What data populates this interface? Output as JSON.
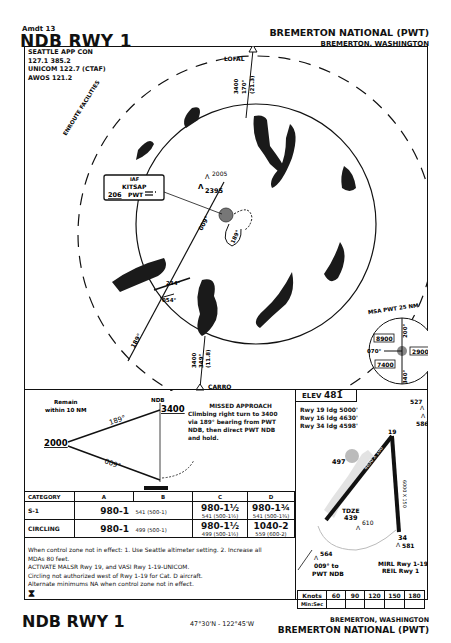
{
  "header": {
    "amendment": "Amdt 13",
    "procedure": "NDB RWY 1",
    "airport": "BREMERTON NATIONAL (PWT)",
    "city": "BREMERTON, WASHINGTON"
  },
  "comms": {
    "line1": "SEATTLE APP CON",
    "line2": "127.1 385.2",
    "line3": "UNICOM 122.7 (CTAF)",
    "line4": "AWOS 121.2"
  },
  "plan_view": {
    "enroute_label": "ENROUTE FACILITIES",
    "fixes": {
      "lofal": {
        "name": "LOFAL",
        "alt": "3400",
        "course": "170°",
        "dist": "(21.3)"
      },
      "carro": {
        "name": "CARRO",
        "alt": "3400",
        "course": "349°",
        "dist": "(11.8)"
      }
    },
    "iaf_box": {
      "label": "IAF",
      "name": "KITSAP",
      "freq": "206",
      "ident": "PWT"
    },
    "obstacles": {
      "o1": "2005",
      "o2": "2395"
    },
    "courses": {
      "inbound": "009°",
      "outbound": "189°",
      "procedure_out": "234°",
      "procedure_in": "054°",
      "radial": "189°"
    },
    "msa": {
      "title": "MSA PWT 25 NM",
      "sector_nw": "8900",
      "sector_e": "2900",
      "sector_sw": "7400",
      "b1": "200°",
      "b2": "070°",
      "b3": "340°"
    }
  },
  "profile": {
    "remain": "Remain",
    "remain2": "within 10 NM",
    "ndb": "NDB",
    "ndb_alt": "3400",
    "hold_alt": "2000",
    "out_course": "189°",
    "in_course": "009°",
    "missed_title": "MISSED APPROACH",
    "missed_text1": "Climbing right turn to 3400",
    "missed_text2": "via 189° bearing from PWT",
    "missed_text3": "NDB, then direct PWT NDB",
    "missed_text4": "and hold."
  },
  "airport_diagram": {
    "elev_label": "ELEV",
    "elev": "481",
    "ldg1": "Rwy 19 ldg 5000'",
    "ldg2": "Rwy 16 ldg 4630'",
    "ldg3": "Rwy 34 ldg 4598'",
    "obs": {
      "o527": "527",
      "o586": "586",
      "o497": "497",
      "o610": "610",
      "o581": "581",
      "o564": "564"
    },
    "tdze_label": "TDZE",
    "tdze": "439",
    "rwy_n1": "1",
    "rwy_n2": "19",
    "rwy_n3": "16",
    "rwy_34": "34",
    "rwy_dims": "6000 X 150",
    "ndb_course": "009° to",
    "ndb_name": "PWT NDB",
    "lighting1": "MIRL Rwy 1-19",
    "lighting2": "REIL Rwy 1"
  },
  "minima": {
    "headers": [
      "CATEGORY",
      "A",
      "B",
      "C",
      "D"
    ],
    "s1": {
      "label": "S-1",
      "ab_mda": "980-1",
      "ab_hat": "541 (500-1)",
      "c_mda": "980-1½",
      "c_hat": "541 (500-1½)",
      "d_mda": "980-1¾",
      "d_hat": "541 (500-1¾)"
    },
    "circling": {
      "label": "CIRCLING",
      "ab_mda": "980-1",
      "ab_hat": "499 (500-1)",
      "c_mda": "980-1½",
      "c_hat": "499 (500-1½)",
      "d_mda": "1040-2",
      "d_hat": "559 (600-2)"
    }
  },
  "notes": {
    "n1": "When control zone not in effect:  1. Use Seattle altimeter setting.  2. Increase all",
    "n1b": "MDAs 80 feet.",
    "n2": "ACTIVATE MALSR Rwy 19, and VASI Rwy 1-19-UNICOM.",
    "n3": "Circling not authorized west of Rwy 1-19 for Cat. D aircraft.",
    "n4": "Alternate minimums NA when control zone not in effect."
  },
  "timing": {
    "knots_label": "Knots",
    "minsec_label": "Min:Sec",
    "speeds": [
      "60",
      "90",
      "120",
      "150",
      "180"
    ]
  },
  "footer": {
    "procedure": "NDB RWY 1",
    "coords": "47°30'N - 122°45'W",
    "city": "BREMERTON, WASHINGTON",
    "airport": "BREMERTON NATIONAL (PWT)"
  }
}
